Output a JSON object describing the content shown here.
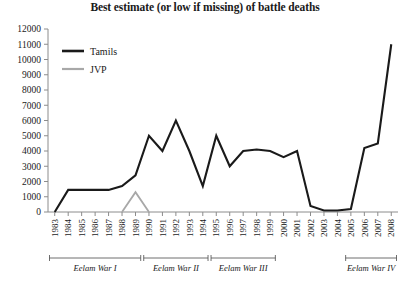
{
  "chart_data": {
    "type": "line",
    "title": "Best estimate (or low if missing) of battle deaths",
    "xlabel": "",
    "ylabel": "",
    "ylim": [
      0,
      12000
    ],
    "ytick_step": 1000,
    "grid": false,
    "legend_position": "top-left",
    "x": [
      1983,
      1984,
      1985,
      1986,
      1987,
      1988,
      1989,
      1990,
      1991,
      1992,
      1993,
      1994,
      1995,
      1996,
      1997,
      1998,
      1999,
      2000,
      2001,
      2002,
      2003,
      2004,
      2005,
      2006,
      2007,
      2008
    ],
    "xtick_labels": [
      "1983",
      "1984",
      "1985",
      "1986",
      "1987",
      "1988",
      "1989",
      "1990",
      "1991",
      "1992",
      "1993",
      "1994",
      "1995",
      "1996",
      "1997",
      "1998",
      "1999",
      "2000",
      "2001",
      "2002",
      "2003",
      "2004",
      "2005",
      "2006",
      "2007",
      "2008"
    ],
    "ytick_labels": [
      "0",
      "1000",
      "2000",
      "3000",
      "4000",
      "5000",
      "6000",
      "7000",
      "8000",
      "9000",
      "10000",
      "11000",
      "12000"
    ],
    "series": [
      {
        "name": "Tamils",
        "color": "#1a1a1a",
        "values": [
          0,
          1450,
          1450,
          1450,
          1450,
          1700,
          2400,
          5000,
          4000,
          6000,
          4000,
          1700,
          5000,
          3000,
          4000,
          4100,
          4000,
          3600,
          4000,
          400,
          100,
          100,
          200,
          4200,
          4500,
          11000
        ]
      },
      {
        "name": "JVP",
        "color": "#a8a8a8",
        "values": [
          null,
          null,
          null,
          null,
          null,
          0,
          1300,
          0,
          null,
          null,
          null,
          null,
          null,
          null,
          null,
          null,
          null,
          null,
          null,
          null,
          null,
          null,
          null,
          null,
          null,
          null
        ]
      }
    ],
    "annotations": [
      {
        "label": "Eelam War I",
        "start_year": 1983,
        "end_year": 1989
      },
      {
        "label": "Eelam War II",
        "start_year": 1990,
        "end_year": 1994
      },
      {
        "label": "Eelam War III",
        "start_year": 1995,
        "end_year": 1999
      },
      {
        "label": "Eelam War IV",
        "start_year": 2005,
        "end_year": 2008
      }
    ]
  },
  "legend": {
    "items": [
      {
        "label": "Tamils",
        "color": "#1a1a1a"
      },
      {
        "label": "JVP",
        "color": "#a8a8a8"
      }
    ]
  }
}
